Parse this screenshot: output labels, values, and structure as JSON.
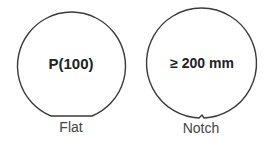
{
  "wafers": [
    {
      "inner_label": "P(100)",
      "caption": "Flat",
      "feature": "flat"
    },
    {
      "inner_label": "≥ 200 mm",
      "caption": "Notch",
      "feature": "notch"
    }
  ],
  "colors": {
    "outline": "#3a3a3a",
    "text": "#222222",
    "caption": "#444444"
  }
}
